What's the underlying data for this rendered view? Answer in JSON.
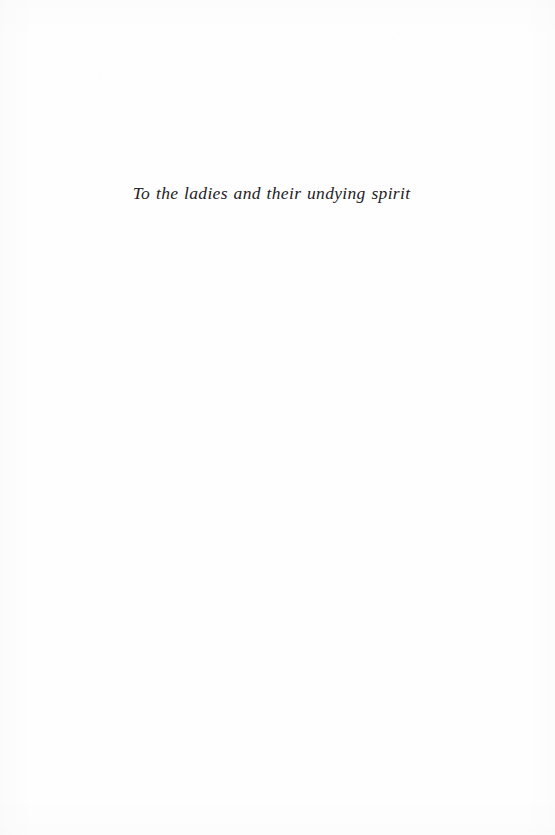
{
  "page": {
    "background_color": "#fefefe",
    "ink_color": "#24211f",
    "width": 555,
    "height": 835
  },
  "dedication": {
    "text": "To the ladies and their undying spirit"
  }
}
